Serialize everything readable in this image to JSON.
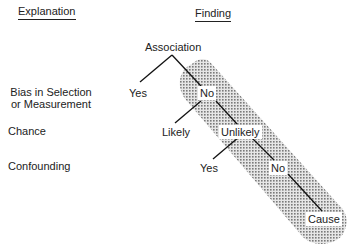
{
  "headers": {
    "explanation": "Explanation",
    "finding": "Finding"
  },
  "explanations": [
    {
      "line1": "Bias in Selection",
      "line2": "or Measurement"
    },
    {
      "line1": "Chance"
    },
    {
      "line1": "Confounding"
    }
  ],
  "tree": {
    "root": "Association",
    "level1": {
      "left": "Yes",
      "right": "No"
    },
    "level2": {
      "left": "Likely",
      "right": "Unlikely"
    },
    "level3": {
      "left": "Yes",
      "right": "No"
    },
    "result": "Cause"
  },
  "colors": {
    "line": "#111111",
    "shade": "#9a9a9a"
  }
}
